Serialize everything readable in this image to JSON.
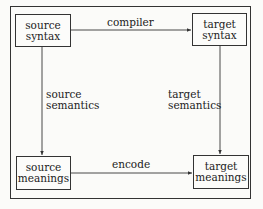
{
  "nodes": {
    "source_syntax": {
      "line1": "source",
      "line2": "syntax"
    },
    "target_syntax": {
      "line1": "target",
      "line2": "syntax"
    },
    "source_meanings": {
      "line1": "source",
      "line2": "meanings"
    },
    "target_meanings": {
      "line1": "target",
      "line2": "meanings"
    }
  },
  "edges": {
    "compiler": "compiler",
    "encode": "encode",
    "source_semantics": {
      "line1": "source",
      "line2": "semantics"
    },
    "target_semantics": {
      "line1": "target",
      "line2": "semantics"
    }
  }
}
